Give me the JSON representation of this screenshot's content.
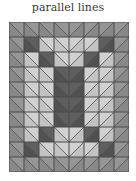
{
  "title": "parallel lines",
  "grid": {
    "columns": 8,
    "rows": 10,
    "cell_size": 15,
    "colors": {
      "M": "#8e8e8e",
      "L": "#c9c9c9",
      "D": "#575757",
      "line": "#4a4a4a"
    },
    "diagonals": [
      "\\",
      "\\",
      "\\",
      "\\",
      "/",
      "/",
      "/",
      "/"
    ],
    "cells": [
      [
        "M",
        "M",
        "M",
        "M",
        "M",
        "M",
        "M",
        "M"
      ],
      [
        "M",
        "D",
        "L",
        "L",
        "L",
        "L",
        "D",
        "M"
      ],
      [
        "M",
        "L",
        "D",
        "L",
        "L",
        "D",
        "L",
        "M"
      ],
      [
        "M",
        "L",
        "L",
        "D",
        "D",
        "L",
        "L",
        "M"
      ],
      [
        "M",
        "L",
        "L",
        "D",
        "D",
        "L",
        "L",
        "M"
      ],
      [
        "M",
        "L",
        "L",
        "D",
        "D",
        "L",
        "L",
        "M"
      ],
      [
        "M",
        "L",
        "L",
        "D",
        "D",
        "L",
        "L",
        "M"
      ],
      [
        "M",
        "L",
        "D",
        "L",
        "L",
        "D",
        "L",
        "M"
      ],
      [
        "M",
        "D",
        "L",
        "L",
        "L",
        "L",
        "D",
        "M"
      ],
      [
        "M",
        "M",
        "M",
        "M",
        "M",
        "M",
        "M",
        "M"
      ]
    ]
  }
}
